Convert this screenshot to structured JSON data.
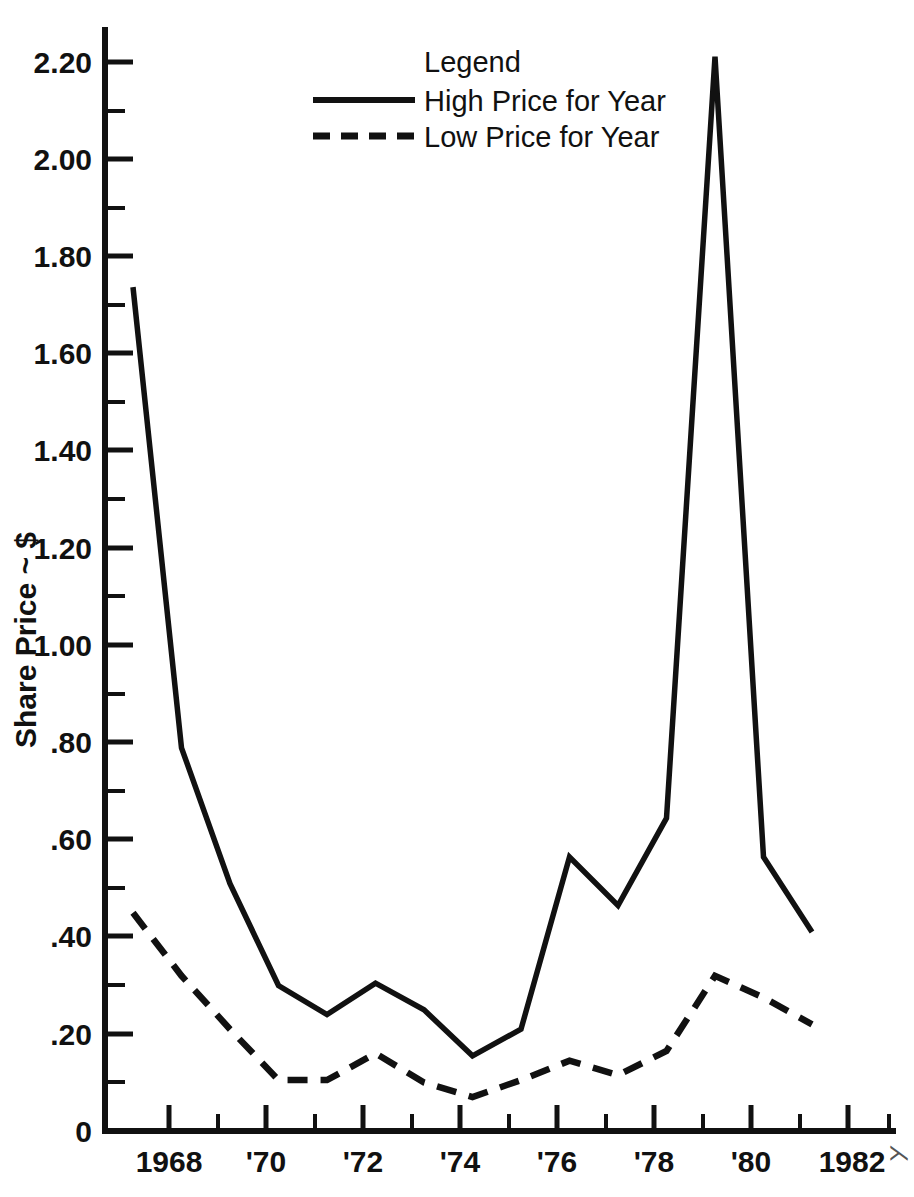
{
  "chart_data": {
    "type": "line",
    "title": "",
    "xlabel": "",
    "ylabel": "Share Price ~ $",
    "xlim": [
      1967.3,
      1984.0
    ],
    "ylim": [
      0,
      2.28
    ],
    "grid": false,
    "legend": {
      "title": "Legend",
      "position": "top-center",
      "entries": [
        {
          "name": "High Price for Year",
          "style": "solid"
        },
        {
          "name": "Low Price for Year",
          "style": "dashed"
        }
      ]
    },
    "x": [
      1968,
      1969,
      1970,
      1971,
      1972,
      1973,
      1974,
      1975,
      1976,
      1977,
      1978,
      1979,
      1980,
      1981,
      1982
    ],
    "series": [
      {
        "name": "High Price for Year",
        "style": "solid",
        "values": [
          1.74,
          0.79,
          0.51,
          0.3,
          0.24,
          0.305,
          0.25,
          0.155,
          0.21,
          0.565,
          0.465,
          0.645,
          2.215,
          0.565,
          0.41
        ]
      },
      {
        "name": "Low Price for Year",
        "style": "dashed",
        "values": [
          0.45,
          0.32,
          0.21,
          0.105,
          0.105,
          0.16,
          0.1,
          0.07,
          0.105,
          0.145,
          0.115,
          0.165,
          0.32,
          0.275,
          0.22
        ]
      }
    ],
    "yticks_major": [
      0,
      0.2,
      0.4,
      0.6,
      0.8,
      1.0,
      1.2,
      1.4,
      1.6,
      1.8,
      2.0,
      2.2
    ],
    "yticks_major_labels": [
      "0",
      ".20",
      ".40",
      ".60",
      ".80",
      "1.00",
      "1.20",
      "1.40",
      "1.60",
      "1.80",
      "2.00",
      "2.20"
    ],
    "yticks_minor": [
      0.1,
      0.3,
      0.5,
      0.7,
      0.9,
      1.1,
      1.3,
      1.5,
      1.7,
      1.9,
      2.1
    ],
    "xticks_major": [
      1968,
      1970,
      1972,
      1974,
      1976,
      1978,
      1980,
      1982,
      1984
    ],
    "xticks_major_labels": [
      "1968",
      "'70",
      "'72",
      "'74",
      "'76",
      "'78",
      "'80",
      "1982",
      ""
    ],
    "xticks_minor": [
      1969,
      1971,
      1973,
      1975,
      1977,
      1979,
      1981,
      1983
    ],
    "colors": {
      "ink": "#111111",
      "background": "#ffffff"
    }
  },
  "axis_labels": {
    "y_title": "Share Price ~ $",
    "y_0": "0",
    "y_020": ".20",
    "y_040": ".40",
    "y_060": ".60",
    "y_080": ".80",
    "y_100": "1.00",
    "y_120": "1.20",
    "y_140": "1.40",
    "y_160": "1.60",
    "y_180": "1.80",
    "y_200": "2.00",
    "y_220": "2.20",
    "x_1968": "1968",
    "x_1970": "'70",
    "x_1972": "'72",
    "x_1974": "'74",
    "x_1976": "'76",
    "x_1978": "'78",
    "x_1980": "'80",
    "x_1982": "1982"
  },
  "legend_text": {
    "title": "Legend",
    "entry_high": "High Price for Year",
    "entry_low": "Low Price for Year"
  }
}
